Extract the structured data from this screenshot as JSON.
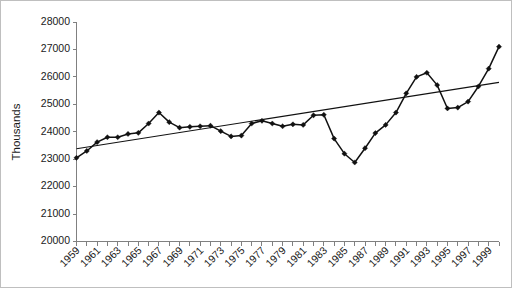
{
  "chart_data": {
    "type": "line",
    "title": "",
    "xlabel": "",
    "ylabel": "Thousands",
    "ylim": [
      20000,
      28000
    ],
    "ytick_labels": [
      "28000",
      "27000",
      "26000",
      "25000",
      "24000",
      "23000",
      "22000",
      "21000",
      "20000"
    ],
    "ytick_values": [
      28000,
      27000,
      26000,
      25000,
      24000,
      23000,
      22000,
      21000,
      20000
    ],
    "xlim": [
      1959,
      2000
    ],
    "grid": false,
    "legend": "none",
    "x": [
      1959,
      1960,
      1961,
      1962,
      1963,
      1964,
      1965,
      1966,
      1967,
      1968,
      1969,
      1970,
      1971,
      1972,
      1973,
      1974,
      1975,
      1976,
      1977,
      1978,
      1979,
      1980,
      1981,
      1982,
      1983,
      1984,
      1985,
      1986,
      1987,
      1988,
      1989,
      1990,
      1991,
      1992,
      1993,
      1994,
      1995,
      1996,
      1997,
      1998,
      1999,
      2000
    ],
    "categories": [
      "1959",
      "1960",
      "1961",
      "1962",
      "1963",
      "1964",
      "1965",
      "1966",
      "1967",
      "1968",
      "1969",
      "1970",
      "1971",
      "1972",
      "1973",
      "1974",
      "1975",
      "1976",
      "1977",
      "1978",
      "1979",
      "1980",
      "1981",
      "1982",
      "1983",
      "1984",
      "1985",
      "1986",
      "1987",
      "1988",
      "1989",
      "1990",
      "1991",
      "1992",
      "1993",
      "1994",
      "1995",
      "1996",
      "1997",
      "1998",
      "1999",
      "2000"
    ],
    "xtick_labels_shown": [
      "1959",
      "1961",
      "1963",
      "1965",
      "1967",
      "1969",
      "1971",
      "1973",
      "1975",
      "1977",
      "1979",
      "1981",
      "1983",
      "1985",
      "1987",
      "1989",
      "1991",
      "1993",
      "1995",
      "1997",
      "1999"
    ],
    "series": [
      {
        "name": "series",
        "marker": "diamond",
        "color": "#111111",
        "values": [
          23050,
          23300,
          23620,
          23800,
          23800,
          23920,
          23960,
          24300,
          24700,
          24350,
          24150,
          24180,
          24200,
          24220,
          24020,
          23830,
          23860,
          24300,
          24400,
          24300,
          24200,
          24270,
          24250,
          24400,
          24500,
          24650,
          24680,
          23750,
          23200,
          22880,
          23400,
          23950,
          24250,
          24700,
          25400,
          26000,
          26150,
          25700,
          24850,
          24880,
          25100,
          25400
        ],
        "values_note": "approximate, read from pixel positions"
      },
      {
        "name": "linear-trend",
        "marker": "none",
        "color": "#111111",
        "endpoints": [
          23380,
          25800
        ]
      }
    ],
    "series_full_correction": {
      "values": [
        23050,
        23300,
        23620,
        23800,
        23800,
        23920,
        23960,
        24300,
        24700,
        24350,
        24150,
        24180,
        24200,
        24220,
        24020,
        23830,
        23860,
        24300,
        24400,
        24300,
        24200,
        24270,
        24250,
        24600,
        24620,
        23750,
        23200,
        22880,
        23400,
        23950,
        24250,
        24700,
        25400,
        26000,
        26150,
        25700,
        24850,
        24880,
        25100,
        25650,
        26300,
        27100
      ]
    }
  },
  "axis": {
    "ylabel": "Thousands"
  }
}
